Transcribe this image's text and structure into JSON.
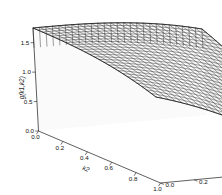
{
  "figure": {
    "kind": "3d-surface-wireframe-plot",
    "background_color": "#ffffff",
    "line_color": "#1a1a1a",
    "surface_fill_color": "#f2f2f2"
  },
  "chart_data": {
    "type": "line",
    "title": "",
    "subtitle": "",
    "plot_kind": "3d wireframe surface",
    "xlabel": "k2",
    "ylabel": "k1",
    "zlabel": "g(k1,k2)",
    "grid": true,
    "legend": "none",
    "xlim": [
      0,
      1
    ],
    "ylim": [
      0,
      1
    ],
    "zlim": [
      0,
      1.75
    ],
    "xticks": [
      "0.0",
      "0.2",
      "0.4",
      "0.6",
      "0.8",
      "1.0"
    ],
    "yticks": [
      "0.0",
      "0.2",
      "0.4",
      "0.6",
      "0.8",
      "1.0"
    ],
    "zticks": [
      "0.0",
      "0.5",
      "1.0",
      "1.5"
    ],
    "xtick_values": [
      0.0,
      0.2,
      0.4,
      0.6,
      0.8,
      1.0
    ],
    "ytick_values": [
      0.0,
      0.2,
      0.4,
      0.6,
      0.8,
      1.0
    ],
    "ztick_values": [
      0.0,
      0.5,
      1.0,
      1.5
    ],
    "mesh_divisions_x": 26,
    "mesh_divisions_y": 26,
    "surface_corner_values": {
      "k1_0_k2_0": 1.75,
      "k1_1_k2_0": 1.75,
      "k1_0_k2_1": 1.75,
      "k1_1_k2_1": 0.0
    },
    "series": [
      {
        "name": "g(k1,k2)",
        "values": [
          1.75,
          1.75,
          1.75,
          0.0
        ]
      }
    ]
  },
  "axes": {
    "z": {
      "label": "g(k1,k2)",
      "ticks": [
        {
          "text": "1.5",
          "x": 18,
          "y": 29
        },
        {
          "text": "1.0",
          "x": 18,
          "y": 65
        },
        {
          "text": "0.5",
          "x": 18,
          "y": 101
        },
        {
          "text": "0.0",
          "x": 18,
          "y": 131
        }
      ]
    },
    "x_left": {
      "label": "k2",
      "ticks": [
        {
          "text": "0.0",
          "x": 30,
          "y": 141
        },
        {
          "text": "0.2",
          "x": 52,
          "y": 150
        },
        {
          "text": "0.4",
          "x": 76,
          "y": 160
        },
        {
          "text": "0.6",
          "x": 100,
          "y": 169
        },
        {
          "text": "0.8",
          "x": 124,
          "y": 178
        },
        {
          "text": "1.0",
          "x": 148,
          "y": 187
        }
      ]
    },
    "x_right": {
      "label": "k1",
      "ticks": [
        {
          "text": "0.0",
          "x": 203,
          "y": 118
        },
        {
          "text": "0.2",
          "x": 199,
          "y": 131
        },
        {
          "text": "0.4",
          "x": 193,
          "y": 145
        },
        {
          "text": "0.6",
          "x": 187,
          "y": 157
        },
        {
          "text": "0.8",
          "x": 181,
          "y": 170
        },
        {
          "text": "1.0",
          "x": 175,
          "y": 187
        }
      ]
    }
  }
}
